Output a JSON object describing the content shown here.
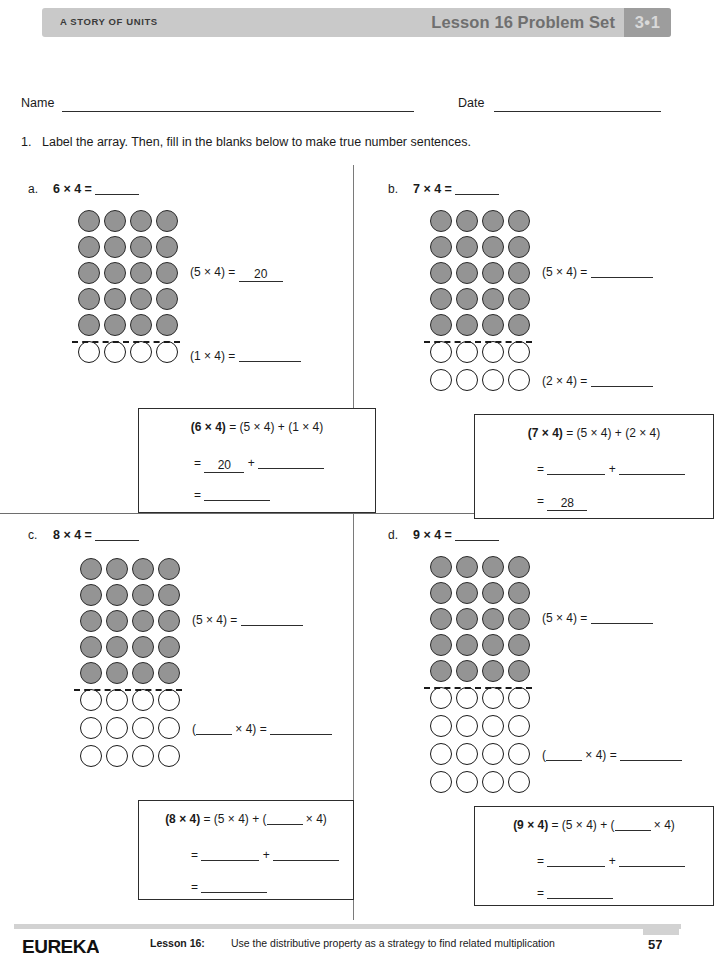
{
  "header": {
    "story_of_units": "A STORY OF UNITS",
    "lesson_title": "Lesson 16 Problem Set",
    "badge": "3•1"
  },
  "name_date": {
    "name_label": "Name",
    "date_label": "Date"
  },
  "problem": {
    "number": "1.",
    "text": "Label the array.  Then, fill in the blanks below to make true number sentences."
  },
  "parts": [
    {
      "letter": "a.",
      "title": "6 × 4 =",
      "shaded_rows": 5,
      "open_rows": 1,
      "columns": 4,
      "side_equations": [
        {
          "label": "(5 × 4) =",
          "value": "20",
          "filled": true
        },
        {
          "label": "(1 × 4) =",
          "value": "",
          "filled": false
        }
      ],
      "box": {
        "line1_bold": "(6 × 4)",
        "line1_rest": " = (5 × 4) + (1 × 4)",
        "line2_prefix": "=",
        "line2_value": "20",
        "line2_filled": true,
        "line2_operator": "+",
        "line2_value2": "",
        "line3_prefix": "=",
        "line3_value": "",
        "line3_filled": false
      }
    },
    {
      "letter": "b.",
      "title": "7 × 4 =",
      "shaded_rows": 5,
      "open_rows": 2,
      "columns": 4,
      "side_equations": [
        {
          "label": "(5 × 4) =",
          "value": "",
          "filled": false
        },
        {
          "label": "(2 × 4) =",
          "value": "",
          "filled": false
        }
      ],
      "box": {
        "line1_bold": "(7 × 4)",
        "line1_rest": " = (5 × 4) + (2 × 4)",
        "line2_prefix": "=",
        "line2_value": "",
        "line2_filled": false,
        "line2_operator": "+",
        "line2_value2": "",
        "line3_prefix": "=",
        "line3_value": "28",
        "line3_filled": true
      }
    },
    {
      "letter": "c.",
      "title": "8 × 4 =",
      "shaded_rows": 5,
      "open_rows": 3,
      "columns": 4,
      "side_equations": [
        {
          "label": "(5 × 4) =",
          "value": "",
          "filled": false
        },
        {
          "label": "(___ × 4) =",
          "value": "",
          "filled": false
        }
      ],
      "box": {
        "line1_bold": "(8 × 4)",
        "line1_rest": " = (5 × 4) + (____ × 4)",
        "line2_prefix": "=",
        "line2_value": "",
        "line2_filled": false,
        "line2_operator": "+",
        "line2_value2": "",
        "line3_prefix": "=",
        "line3_value": "",
        "line3_filled": false
      }
    },
    {
      "letter": "d.",
      "title": "9 × 4 =",
      "shaded_rows": 5,
      "open_rows": 4,
      "columns": 4,
      "side_equations": [
        {
          "label": "(5 × 4) =",
          "value": "",
          "filled": false
        },
        {
          "label": "(___ × 4) =",
          "value": "",
          "filled": false
        }
      ],
      "box": {
        "line1_bold": "(9 × 4)",
        "line1_rest": " = (5 × 4) + (____ × 4)",
        "line2_prefix": "=",
        "line2_value": "",
        "line2_filled": false,
        "line2_operator": "+",
        "line2_value2": "",
        "line3_prefix": "=",
        "line3_value": "",
        "line3_filled": false
      }
    }
  ],
  "footer": {
    "brand": "EUREKA",
    "lesson_label": "Lesson 16:",
    "description": "Use the distributive property as a strategy to find related multiplication",
    "page": "57"
  },
  "colors": {
    "header_bar": "#c9c9c9",
    "header_badge": "#9d9d9d",
    "shaded_dot": "#949494",
    "ink": "#1a1a1a"
  }
}
